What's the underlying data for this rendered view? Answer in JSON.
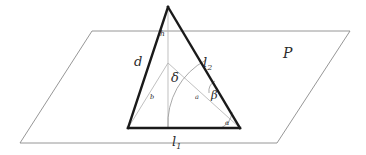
{
  "figure": {
    "background_color": "#ffffff",
    "plane": {
      "name": "plane-P",
      "label": "ᵊB",
      "label_text": "P",
      "stroke_color": "#8a8a8a",
      "stroke_width": 0.9,
      "points": "92,31 350,31 277,143 20,143"
    },
    "triangle": {
      "name": "main-triangle",
      "stroke_color": "#1a1a1a",
      "stroke_width": 2.4,
      "apex": {
        "x": 168,
        "y": 7
      },
      "bottom_left": {
        "x": 128,
        "y": 128
      },
      "bottom_right": {
        "x": 240,
        "y": 128
      }
    },
    "interior_point": {
      "x": 168,
      "y": 63
    },
    "foot_point": {
      "x": 168,
      "y": 128
    },
    "beta_point": {
      "x": 221,
      "y": 88
    },
    "thin_stroke_color": "#b0b0b0",
    "thin_stroke_width": 0.85,
    "labels": [
      {
        "name": "label-h",
        "text": "h",
        "x": 160,
        "y": 36,
        "size": "lbl-sm"
      },
      {
        "name": "label-d",
        "text": "d",
        "x": 134,
        "y": 66,
        "size": "lbl-lg"
      },
      {
        "name": "label-b",
        "text": "b",
        "x": 150,
        "y": 99,
        "size": "lbl-xs"
      },
      {
        "name": "label-a",
        "text": "a",
        "x": 195,
        "y": 99,
        "size": "lbl-xs"
      },
      {
        "name": "label-delta",
        "text": "δ",
        "x": 171,
        "y": 82,
        "size": "lbl-lg"
      },
      {
        "name": "label-beta",
        "text": "β",
        "x": 211,
        "y": 99,
        "size": "lbl-md"
      },
      {
        "name": "label-alpha",
        "text": "α",
        "x": 225,
        "y": 125,
        "size": "lbl-xs"
      }
    ],
    "side_labels": [
      {
        "name": "label-l1",
        "base": "l",
        "sub": "1",
        "x": 172,
        "y": 146
      },
      {
        "name": "label-l2",
        "base": "l",
        "sub": "2",
        "x": 203,
        "y": 67
      }
    ],
    "plane_label": {
      "name": "label-plane-p",
      "text": "P",
      "x": 283,
      "y": 58
    },
    "arcs": {
      "delta_arc": {
        "name": "delta-angle-arc",
        "path": "M 206,60 A 68,68 0 0 0 168,128"
      },
      "alpha_arc": {
        "name": "alpha-angle-arc",
        "path": "M 222,128 A 18,18 0 0 0 231,113"
      },
      "beta_arc": {
        "name": "beta-angle-arc",
        "path": "M 210,92 A 11,11 0 0 1 216,81"
      }
    }
  }
}
